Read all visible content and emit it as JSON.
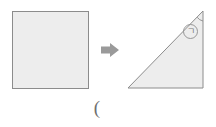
{
  "figure": {
    "title": "",
    "background_color": "#ffffff",
    "shape_fill": "#ededed",
    "shape_stroke": "#8c8c8c",
    "arrow_color": "#9a9a9a",
    "annotation_color": "#7a7a7a",
    "shapes": {
      "square": {
        "name": "square",
        "fill": "#ededed",
        "stroke": "#8c8c8c",
        "x": 12,
        "y": 11,
        "width": 76,
        "height": 77
      },
      "triangle": {
        "name": "right-triangle",
        "fill": "#ededed",
        "stroke": "#8c8c8c",
        "points": "128,88 203,88 203,11",
        "right_angle_vertex": "203,88",
        "apex_vertex": "203,11"
      }
    },
    "arrow": {
      "name": "transform-arrow",
      "direction": "right",
      "color": "#9a9a9a",
      "x": 101,
      "y": 43,
      "width": 18,
      "height": 14
    },
    "annotations": {
      "angle_arc": {
        "name": "apex-angle-arc",
        "color": "#8c8c8c",
        "at_vertex": "203,11"
      },
      "angle_label": {
        "name": "circled-giyeok-label",
        "glyph": "ㄱ",
        "circled": true,
        "color": "#7a7a7a",
        "cx": 190,
        "cy": 31,
        "r": 7
      }
    },
    "caption": {
      "name": "bottom-caption",
      "text": "(",
      "color": "#6f6f6f",
      "x": 95,
      "y": 108
    }
  }
}
